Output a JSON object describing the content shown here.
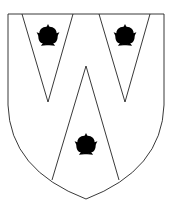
{
  "figure": {
    "colors": {
      "field": "#ffffff",
      "line": "#222222"
    },
    "charges": [
      {
        "name": "rose",
        "position": "upper-left pile"
      },
      {
        "name": "rose",
        "position": "upper-right pile"
      },
      {
        "name": "rose",
        "position": "lower-center pile"
      }
    ]
  }
}
